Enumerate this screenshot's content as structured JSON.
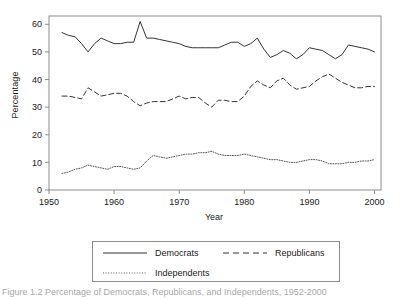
{
  "chart_data": {
    "type": "line",
    "title": "",
    "xlabel": "Year",
    "ylabel": "Percentage",
    "xlim": [
      1950,
      2001
    ],
    "ylim": [
      0,
      63
    ],
    "xticks": [
      1950,
      1960,
      1970,
      1980,
      1990,
      2000
    ],
    "xtick_labels": [
      "1950",
      "1960",
      "1970",
      "1980",
      "1990",
      "2000"
    ],
    "yticks": [
      0,
      10,
      20,
      30,
      40,
      50,
      60
    ],
    "ytick_labels": [
      "0",
      "10",
      "20",
      "30",
      "40",
      "50",
      "60"
    ],
    "grid": false,
    "legend_position": "below-plot",
    "x": [
      1952,
      1953,
      1954,
      1955,
      1956,
      1957,
      1958,
      1959,
      1960,
      1961,
      1962,
      1963,
      1964,
      1965,
      1966,
      1967,
      1968,
      1969,
      1970,
      1971,
      1972,
      1973,
      1974,
      1975,
      1976,
      1977,
      1978,
      1979,
      1980,
      1981,
      1982,
      1983,
      1984,
      1985,
      1986,
      1987,
      1988,
      1989,
      1990,
      1991,
      1992,
      1993,
      1994,
      1995,
      1996,
      1997,
      1998,
      1999,
      2000
    ],
    "series": [
      {
        "name": "Democrats",
        "linestyle": "solid",
        "color": "#333333",
        "values": [
          57.0,
          56.0,
          55.5,
          53.0,
          50.0,
          53.0,
          55.0,
          54.0,
          53.0,
          53.0,
          53.5,
          53.5,
          61.0,
          55.0,
          55.0,
          54.5,
          54.0,
          53.5,
          53.0,
          52.0,
          51.5,
          51.5,
          51.5,
          51.5,
          51.5,
          52.5,
          53.5,
          53.5,
          52.0,
          53.0,
          55.0,
          51.0,
          48.0,
          49.0,
          50.5,
          49.5,
          47.5,
          49.0,
          51.5,
          51.0,
          50.5,
          49.0,
          47.5,
          49.0,
          52.5,
          52.0,
          51.5,
          51.0,
          50.0
        ]
      },
      {
        "name": "Republicans",
        "linestyle": "dashed",
        "color": "#333333",
        "values": [
          34.0,
          34.0,
          33.5,
          33.0,
          37.0,
          35.5,
          34.0,
          34.5,
          35.0,
          35.0,
          34.0,
          32.0,
          30.5,
          31.5,
          32.0,
          32.0,
          32.0,
          33.0,
          34.0,
          33.0,
          33.5,
          33.5,
          31.5,
          30.0,
          32.5,
          32.5,
          32.0,
          32.0,
          34.0,
          37.5,
          39.5,
          38.0,
          37.0,
          39.5,
          40.5,
          38.0,
          36.5,
          37.0,
          37.5,
          39.5,
          41.0,
          42.0,
          40.5,
          39.0,
          38.0,
          37.0,
          37.0,
          37.5,
          37.5
        ]
      },
      {
        "name": "Independents",
        "linestyle": "dotted",
        "color": "#555555",
        "values": [
          6.0,
          6.5,
          7.5,
          8.0,
          9.0,
          8.5,
          8.0,
          7.5,
          8.5,
          8.5,
          8.0,
          7.5,
          8.0,
          10.5,
          12.5,
          12.0,
          11.5,
          12.0,
          12.5,
          13.0,
          13.0,
          13.5,
          13.5,
          14.0,
          13.0,
          12.5,
          12.5,
          12.5,
          13.0,
          12.5,
          12.0,
          11.5,
          11.0,
          11.0,
          10.5,
          10.0,
          10.0,
          10.5,
          11.0,
          11.0,
          10.5,
          9.5,
          9.5,
          9.5,
          10.0,
          10.0,
          10.5,
          10.5,
          11.0
        ]
      }
    ]
  },
  "axes": {
    "y_title": "Percentage",
    "x_title": "Year"
  },
  "legend": {
    "entries": [
      {
        "label": "Democrats",
        "style": "solid"
      },
      {
        "label": "Republicans",
        "style": "dashed"
      },
      {
        "label": "Independents",
        "style": "dotted"
      }
    ]
  },
  "caption": {
    "text": "Figure 1.2 Percentage of Democrats, Republicans, and Independents, 1952-2000"
  }
}
